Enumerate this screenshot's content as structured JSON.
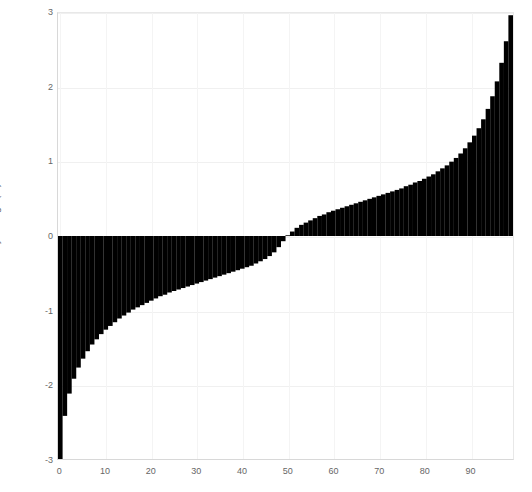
{
  "chart_data": {
    "type": "bar",
    "title": "",
    "subtitle": "",
    "xlabel": "",
    "ylabel": "FTSE 100 Daily Change (%)",
    "xlim": [
      -0.5,
      99.5
    ],
    "ylim": [
      -3,
      3
    ],
    "grid": true,
    "legend": null,
    "bar_color": "#000000",
    "background_color": "#ffffff",
    "grid_color": "#f0f0f0",
    "axis_color": "#d8d8d8",
    "tick_label_color": "#666666",
    "ytick_labels": [
      "3",
      "2",
      "1",
      "0",
      "-1",
      "-2",
      "-3"
    ],
    "ytick_values": [
      3,
      2,
      1,
      0,
      -1,
      -2,
      -3
    ],
    "xtick_labels": [
      "0",
      "10",
      "20",
      "30",
      "40",
      "50",
      "60",
      "70",
      "80",
      "90"
    ],
    "xtick_values": [
      0,
      10,
      20,
      30,
      40,
      50,
      60,
      70,
      80,
      90
    ],
    "categories": [
      0,
      1,
      2,
      3,
      4,
      5,
      6,
      7,
      8,
      9,
      10,
      11,
      12,
      13,
      14,
      15,
      16,
      17,
      18,
      19,
      20,
      21,
      22,
      23,
      24,
      25,
      26,
      27,
      28,
      29,
      30,
      31,
      32,
      33,
      34,
      35,
      36,
      37,
      38,
      39,
      40,
      41,
      42,
      43,
      44,
      45,
      46,
      47,
      48,
      49,
      50,
      51,
      52,
      53,
      54,
      55,
      56,
      57,
      58,
      59,
      60,
      61,
      62,
      63,
      64,
      65,
      66,
      67,
      68,
      69,
      70,
      71,
      72,
      73,
      74,
      75,
      76,
      77,
      78,
      79,
      80,
      81,
      82,
      83,
      84,
      85,
      86,
      87,
      88,
      89,
      90,
      91,
      92,
      93,
      94,
      95,
      96,
      97,
      98,
      99
    ],
    "values": [
      -3.0,
      -2.42,
      -2.12,
      -1.92,
      -1.77,
      -1.65,
      -1.55,
      -1.46,
      -1.39,
      -1.32,
      -1.26,
      -1.21,
      -1.16,
      -1.11,
      -1.07,
      -1.03,
      -0.99,
      -0.96,
      -0.93,
      -0.9,
      -0.87,
      -0.84,
      -0.81,
      -0.79,
      -0.76,
      -0.74,
      -0.72,
      -0.7,
      -0.68,
      -0.66,
      -0.64,
      -0.62,
      -0.6,
      -0.58,
      -0.56,
      -0.54,
      -0.52,
      -0.5,
      -0.48,
      -0.46,
      -0.44,
      -0.42,
      -0.4,
      -0.37,
      -0.34,
      -0.31,
      -0.27,
      -0.22,
      -0.15,
      -0.07,
      0.01,
      0.06,
      0.11,
      0.15,
      0.18,
      0.21,
      0.24,
      0.27,
      0.29,
      0.32,
      0.34,
      0.36,
      0.38,
      0.4,
      0.42,
      0.44,
      0.46,
      0.48,
      0.5,
      0.52,
      0.54,
      0.56,
      0.58,
      0.6,
      0.62,
      0.64,
      0.67,
      0.69,
      0.72,
      0.74,
      0.77,
      0.8,
      0.83,
      0.87,
      0.91,
      0.95,
      1.0,
      1.05,
      1.11,
      1.18,
      1.26,
      1.35,
      1.45,
      1.57,
      1.71,
      1.88,
      2.08,
      2.33,
      2.62,
      2.97
    ]
  }
}
